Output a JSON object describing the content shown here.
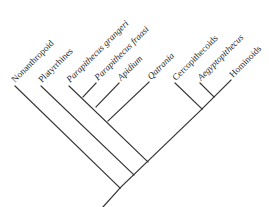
{
  "diagram": {
    "type": "cladogram",
    "line_color": "#333333",
    "text_color": "#2a2a2a",
    "background": "#ffffff",
    "taxa": [
      {
        "id": "nonanthropoid",
        "label": "Nonanthropoid",
        "italic": false
      },
      {
        "id": "platyrrhines",
        "label": "Platyrrhines",
        "italic": false
      },
      {
        "id": "parapithecus-grangeri",
        "label": "Parapithecus grangeri",
        "italic": true
      },
      {
        "id": "parapithecus-fraasi",
        "label": "Parapithecus fraasi",
        "italic": true
      },
      {
        "id": "apidium",
        "label": "Apidium",
        "italic": true
      },
      {
        "id": "qatrania",
        "label": "Qatrania",
        "italic": true
      },
      {
        "id": "cercopithecoids",
        "label": "Cercopithecoids",
        "italic": false
      },
      {
        "id": "aegyptopithecus",
        "label": "Aegyptopithecus",
        "italic": true
      },
      {
        "id": "hominoids",
        "label": "Hominoids",
        "italic": false
      }
    ],
    "topology": "(Nonanthropoid,(Platyrrhines,(((((Parapithecus grangeri,Parapithecus fraasi),Apidium),Qatrania)),(Cercopithecoids,(Aegyptopithecus,Hominoids)))))"
  }
}
